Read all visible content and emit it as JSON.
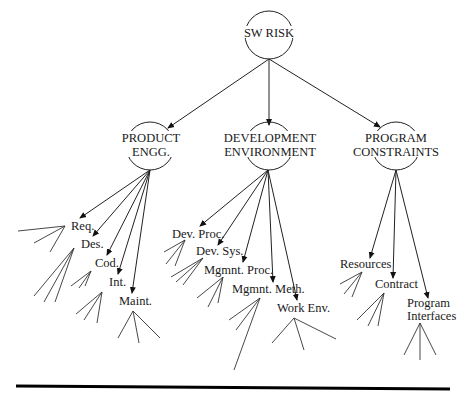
{
  "diagram": {
    "title": "SW RISK",
    "root": {
      "label": "SW RISK"
    },
    "categories": [
      {
        "label_line1": "PRODUCT",
        "label_line2": "ENGG.",
        "children": [
          "Req.",
          "Des.",
          "Cod.",
          "Int.",
          "Maint."
        ]
      },
      {
        "label_line1": "DEVELOPMENT",
        "label_line2": "ENVIRONMENT",
        "children": [
          "Dev. Proc.",
          "Dev. Sys.",
          "Mgmnt. Proc.",
          "Mgmnt. Meth.",
          "Work Env."
        ]
      },
      {
        "label_line1": "PROGRAM",
        "label_line2": "CONSTRAINTS",
        "children": [
          "Resources",
          "Contract",
          "Program",
          "Interfaces"
        ]
      }
    ],
    "leaf_labels": {
      "program_interfaces_line1": "Program",
      "program_interfaces_line2": "Interfaces"
    },
    "colors": {
      "stroke": "#222222",
      "background": "#ffffff",
      "rule": "#000000"
    }
  }
}
